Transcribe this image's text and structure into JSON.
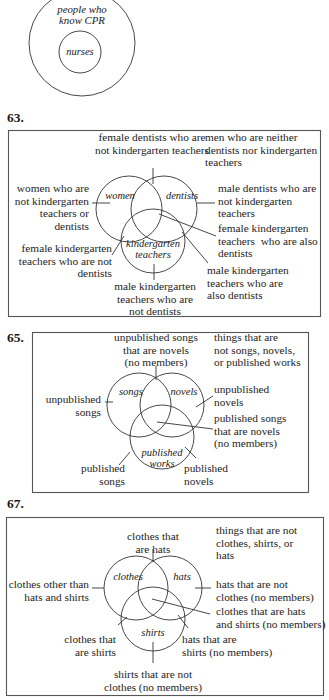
{
  "diagram_61": {
    "outer_label": "people who\nknow CPR",
    "inner_label": "nurses"
  },
  "diagram_63": {
    "number": "63.",
    "circles": {
      "a": "women",
      "b": "dentists",
      "c": "kindergarten\nteachers"
    },
    "labels": {
      "top": "female dentists who are\nnot kindergarten teachers",
      "top_right": "men who are neither\ndentists nor kindergarten\nteachers",
      "left": "women who are\nnot kindergarten\nteachers or\ndentists",
      "right": "male dentists who are\nnot kindergarten\nteachers",
      "center_right": "female kindergarten\nteachers  who are also\ndentists",
      "bottom_left": "female kindergarten\nteachers who are not\ndentists",
      "bottom_right": "male kindergarten\nteachers who are\nalso dentists",
      "bottom": "male kindergarten\nteachers who are\nnot dentists"
    }
  },
  "diagram_65": {
    "number": "65.",
    "circles": {
      "a": "songs",
      "b": "novels",
      "c": "published\nworks"
    },
    "labels": {
      "top": "unpublished songs\nthat are novels\n(no members)",
      "top_right": "things that are\nnot songs, novels,\nor published works",
      "left": "unpublished\nsongs",
      "right": "unpublished\nnovels",
      "center_right": "published songs\nthat are novels\n(no members)",
      "bottom_left": "published\nsongs",
      "bottom_right": "published\nnovels"
    }
  },
  "diagram_67": {
    "number": "67.",
    "circles": {
      "a": "clothes",
      "b": "hats",
      "c": "shirts"
    },
    "labels": {
      "top": "clothes that\nare hats",
      "top_right": "things that are not\nclothes, shirts, or\nhats",
      "left": "clothes other than\nhats and shirts",
      "right": "hats that are not\nclothes (no members)",
      "center_right": "clothes that are hats\nand shirts (no members)",
      "bottom_left": "clothes that\nare shirts",
      "bottom_right": "hats that are\nshirts (no members)",
      "bottom": "shirts that are not\nclothes (no members)"
    }
  }
}
